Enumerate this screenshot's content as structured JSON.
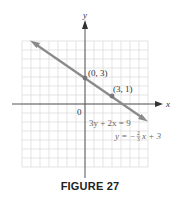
{
  "figure": {
    "caption": "FIGURE 27"
  },
  "chart_data": {
    "type": "line",
    "title": "",
    "xlabel": "x",
    "ylabel": "y",
    "origin_label": "0",
    "xlim": [
      -7,
      7
    ],
    "ylim": [
      -7,
      7
    ],
    "grid": true,
    "series": [
      {
        "name": "3y + 2x = 9",
        "equation": "3y + 2x = 9",
        "slope_intercept": "y = -2/3 x + 3",
        "x": [
          -6,
          7
        ],
        "y": [
          7,
          -1.67
        ],
        "color": "#8a8a8a"
      }
    ],
    "points": [
      {
        "label": "(0, 3)",
        "x": 0,
        "y": 3
      },
      {
        "label": "(3, 1)",
        "x": 3,
        "y": 1
      }
    ],
    "annotations": [
      {
        "text": "3y + 2x = 9"
      },
      {
        "text": "y = -2/3 x + 3"
      }
    ]
  },
  "labels": {
    "x_axis": "x",
    "y_axis": "y",
    "origin": "0",
    "point_a": "(0, 3)",
    "point_b": "(3, 1)",
    "eq_standard": "3y + 2x = 9",
    "eq_slope_prefix": "y = −",
    "eq_slope_num": "2",
    "eq_slope_den": "3",
    "eq_slope_suffix": "x + 3"
  },
  "colors": {
    "grid": "#d6d6d6",
    "axis": "#555555",
    "line": "#8a8a8a",
    "text": "#333333"
  }
}
